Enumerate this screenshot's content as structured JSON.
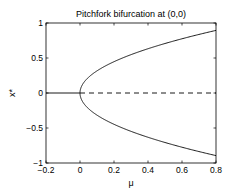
{
  "chart_data": {
    "type": "line",
    "title": "Pitchfork bifurcation at (0,0)",
    "xlabel": "μ",
    "ylabel": "x*",
    "xlim": [
      -0.2,
      0.8
    ],
    "ylim": [
      -1,
      1
    ],
    "xticks": [
      -0.2,
      0,
      0.2,
      0.4,
      0.6,
      0.8
    ],
    "xtick_labels": [
      "-0.2",
      "0",
      "0.2",
      "0.4",
      "0.6",
      "0.8"
    ],
    "yticks": [
      -1,
      -0.5,
      0,
      0.5,
      1
    ],
    "ytick_labels": [
      "-1",
      "-0.5",
      "0",
      "0.5",
      "1"
    ],
    "grid": false,
    "series": [
      {
        "name": "stable trivial branch",
        "style": "solid",
        "function": "x*=0",
        "x": [
          -0.2,
          0
        ],
        "y": [
          0,
          0
        ]
      },
      {
        "name": "unstable trivial branch",
        "style": "dashed",
        "function": "x*=0",
        "x": [
          0,
          0.8
        ],
        "y": [
          0,
          0
        ]
      },
      {
        "name": "upper stable branch",
        "style": "solid",
        "function": "x*=sqrt(mu)",
        "x": [
          0,
          0.05,
          0.1,
          0.2,
          0.3,
          0.4,
          0.5,
          0.6,
          0.7,
          0.8
        ],
        "y": [
          0,
          0.224,
          0.316,
          0.447,
          0.548,
          0.632,
          0.707,
          0.775,
          0.837,
          0.894
        ]
      },
      {
        "name": "lower stable branch",
        "style": "solid",
        "function": "x*=-sqrt(mu)",
        "x": [
          0,
          0.05,
          0.1,
          0.2,
          0.3,
          0.4,
          0.5,
          0.6,
          0.7,
          0.8
        ],
        "y": [
          0,
          -0.224,
          -0.316,
          -0.447,
          -0.548,
          -0.632,
          -0.707,
          -0.775,
          -0.837,
          -0.894
        ]
      }
    ]
  }
}
